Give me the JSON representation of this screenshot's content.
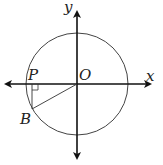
{
  "diagram": {
    "labels": {
      "y_axis": "y",
      "x_axis": "x",
      "origin": "O",
      "point_p": "P",
      "point_b": "B"
    },
    "geometry": {
      "center": [
        77,
        84
      ],
      "radius": 51,
      "point_b": [
        32,
        109
      ],
      "point_p": [
        32,
        84
      ]
    },
    "colors": {
      "axis": "#111111",
      "circle": "#444444",
      "text": "#222222"
    }
  }
}
